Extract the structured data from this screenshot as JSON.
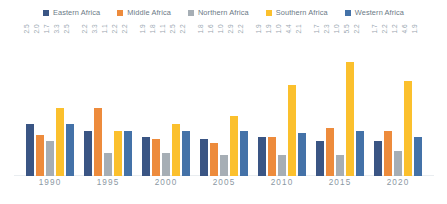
{
  "chart_data": {
    "type": "bar",
    "title": "",
    "xlabel": "",
    "ylabel": "",
    "ylim": [
      0,
      6
    ],
    "grid": false,
    "legend_position": "top-center",
    "categories": [
      "1990",
      "1995",
      "2000",
      "2005",
      "2010",
      "2015",
      "2020"
    ],
    "series": [
      {
        "name": "Eastern Africa",
        "color": "#3a5584",
        "values": [
          2.5,
          2.2,
          1.9,
          1.8,
          1.9,
          1.7,
          1.7
        ],
        "labels": [
          "2.5",
          "2.2",
          "1.9",
          "1.8",
          "1.9",
          "1.7",
          "1.7"
        ]
      },
      {
        "name": "Middle Africa",
        "color": "#ed8b3c",
        "values": [
          2.0,
          3.3,
          1.8,
          1.6,
          1.9,
          2.3,
          2.2
        ],
        "labels": [
          "2.0",
          "3.3",
          "1.8",
          "1.6",
          "1.9",
          "2.3",
          "2.2"
        ]
      },
      {
        "name": "Northern Africa",
        "color": "#a6aeb5",
        "values": [
          1.7,
          1.1,
          1.1,
          1.0,
          1.0,
          1.0,
          1.2
        ],
        "labels": [
          "1.7",
          "1.1",
          "1.1",
          "1.0",
          "1.0",
          "1.0",
          "1.2"
        ]
      },
      {
        "name": "Southern Africa",
        "color": "#fbc02d",
        "values": [
          3.3,
          2.2,
          2.5,
          2.9,
          4.4,
          5.5,
          4.6
        ],
        "labels": [
          "3.3",
          "2.2",
          "2.5",
          "2.9",
          "4.4",
          "5.5",
          "4.6"
        ]
      },
      {
        "name": "Western Africa",
        "color": "#4472a8",
        "values": [
          2.5,
          2.2,
          2.2,
          2.2,
          2.1,
          2.2,
          1.9
        ],
        "labels": [
          "2.5",
          "2.2",
          "2.2",
          "2.2",
          "2.1",
          "2.2",
          "1.9"
        ]
      }
    ]
  }
}
